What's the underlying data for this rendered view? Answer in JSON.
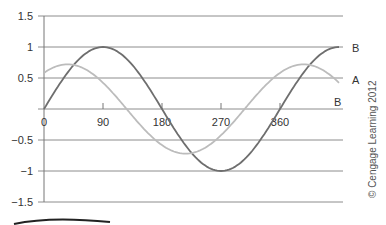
{
  "chart_data": {
    "type": "line",
    "title": "",
    "xlabel": "",
    "ylabel": "",
    "xlim": [
      0,
      450
    ],
    "ylim": [
      -1.5,
      1.5
    ],
    "grid": true,
    "x_ticks": [
      0,
      90,
      180,
      270,
      360
    ],
    "x_tick_labels": [
      "0",
      "90",
      "180",
      "270",
      "360"
    ],
    "y_ticks": [
      1.5,
      1,
      0.5,
      -0.5,
      -1,
      -1.5
    ],
    "y_tick_labels": [
      "1.5",
      "1",
      "0.5",
      "-0.5",
      "-1",
      "-1.5"
    ],
    "series": [
      {
        "name": "B",
        "color": "#6e6e6e",
        "amplitude": 1.0,
        "phase_deg": 0,
        "x": [
          0,
          45,
          90,
          135,
          180,
          225,
          270,
          315,
          360,
          405,
          450
        ],
        "values": [
          0,
          0.71,
          1,
          0.71,
          0,
          -0.71,
          -1,
          -0.71,
          0,
          0.71,
          1
        ]
      },
      {
        "name": "A",
        "color": "#bcbcbc",
        "amplitude": 0.72,
        "phase_deg": 54,
        "x": [
          0,
          36,
          90,
          126,
          180,
          216,
          270,
          306,
          360,
          396,
          450
        ],
        "values": [
          0.58,
          0.72,
          0.42,
          0,
          -0.58,
          -0.72,
          -0.42,
          0,
          0.58,
          0.72,
          0.42
        ]
      }
    ],
    "annotations": [
      {
        "text": "B",
        "position": "right end at y=1"
      },
      {
        "text": "A",
        "position": "right end at y=0.5"
      },
      {
        "text": "B",
        "position": "right end at y=0 (axis)"
      }
    ]
  },
  "labels": {
    "right_B_top": "B",
    "right_A": "A",
    "right_B_axis": "B",
    "credit": "© Cengage Learning 2012"
  }
}
